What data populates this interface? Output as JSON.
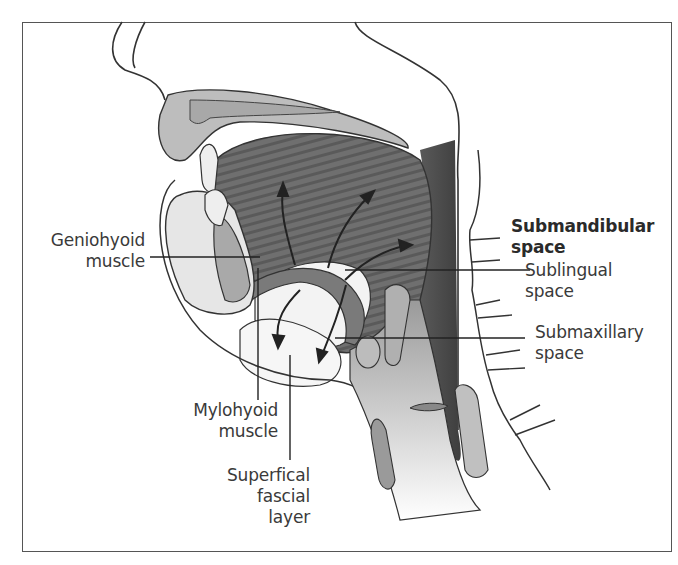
{
  "figure": {
    "labels": {
      "geniohyoid": {
        "line1": "Geniohyoid",
        "line2": "muscle"
      },
      "submandibular": {
        "line1": "Submandibular",
        "line2": "space"
      },
      "sublingual": {
        "line1": "Sublingual",
        "line2": "space"
      },
      "submaxillary": {
        "line1": "Submaxillary",
        "line2": "space"
      },
      "mylohyoid": {
        "line1": "Mylohyoid",
        "line2": "muscle"
      },
      "superficial": {
        "line1": "Superfical",
        "line2": "fascial",
        "line3": "layer"
      }
    },
    "colors": {
      "outline": "#333333",
      "muscle_dark": "#6e6e6e",
      "muscle_mid": "#8c8c8c",
      "tissue_light": "#c8c8c8",
      "tissue_pale": "#e6e6e6",
      "space_white": "#f7f7f7",
      "neck_dark": "#4d4d4d",
      "text": "#3a3a3a"
    }
  }
}
